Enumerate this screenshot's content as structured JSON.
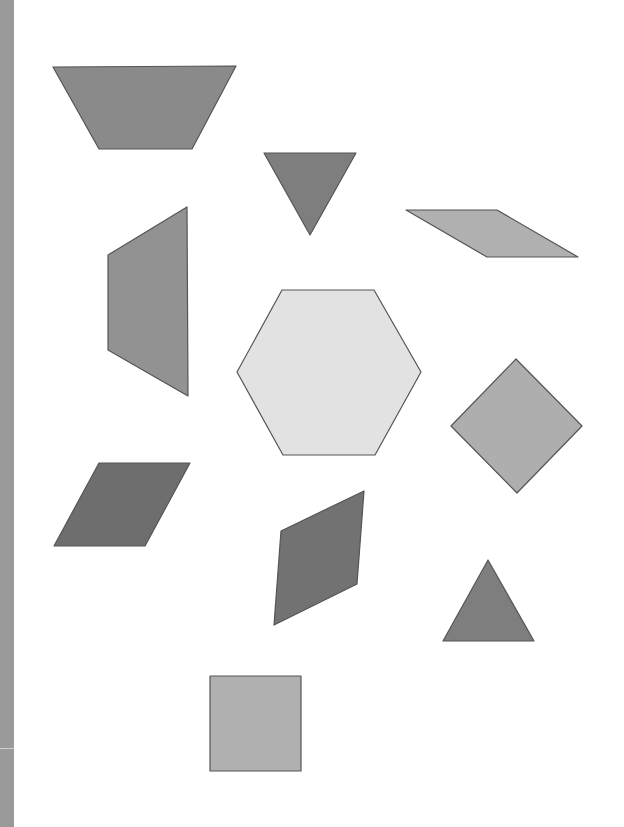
{
  "page": {
    "width": 624,
    "height": 827,
    "background": "#ffffff"
  },
  "left_bar": {
    "color": "#9a9a9a"
  },
  "shapes": [
    {
      "name": "trapezoid-top-left",
      "kind": "trapezoid",
      "points": "53,67 236,66 192,149 99,149",
      "fill": "#8a8a8a"
    },
    {
      "name": "triangle-down",
      "kind": "triangle",
      "points": "264,153 356,153 310,235",
      "fill": "#7e7e7e"
    },
    {
      "name": "thin-rhombus",
      "kind": "rhombus",
      "points": "406,210 497,210 578,257 487,257",
      "fill": "#b0b0b0"
    },
    {
      "name": "trapezoid-vertical",
      "kind": "trapezoid",
      "points": "187,207 188,396 108,350 108,255",
      "fill": "#929292"
    },
    {
      "name": "hexagon",
      "kind": "hexagon",
      "points": "282,290 374,290 421,372 375,455 283,455 237,372",
      "fill": "#e2e2e2"
    },
    {
      "name": "diamond-square",
      "kind": "square",
      "points": "516,359 582,426 517,493 451,426",
      "fill": "#aeaeae"
    },
    {
      "name": "rhombus-left",
      "kind": "rhombus",
      "points": "99,463 190,463 145,546 54,546",
      "fill": "#6e6e6e"
    },
    {
      "name": "rhombus-center",
      "kind": "rhombus",
      "points": "364,491 357,584 274,625 281,531",
      "fill": "#727272"
    },
    {
      "name": "triangle-up",
      "kind": "triangle",
      "points": "488,560 534,641 443,641",
      "fill": "#7e7e7e"
    },
    {
      "name": "square-bottom",
      "kind": "square",
      "points": "210,676 301,676 301,771 210,771",
      "fill": "#b0b0b0"
    }
  ],
  "stroke": "#555555"
}
